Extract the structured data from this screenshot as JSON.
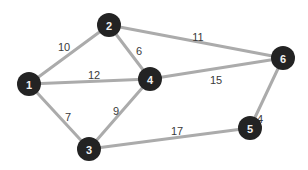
{
  "diagram": {
    "type": "weighted-undirected-graph",
    "colors": {
      "background": "#ffffff",
      "node_fill": "#232323",
      "node_text": "#f2f2f2",
      "edge": "#ababab",
      "edge_label": "#3a3a3a"
    },
    "node_radius": 12,
    "nodes": [
      {
        "id": "1",
        "label": "1",
        "x": 29,
        "y": 84
      },
      {
        "id": "2",
        "label": "2",
        "x": 109,
        "y": 25
      },
      {
        "id": "3",
        "label": "3",
        "x": 89,
        "y": 149
      },
      {
        "id": "4",
        "label": "4",
        "x": 150,
        "y": 79
      },
      {
        "id": "5",
        "label": "5",
        "x": 250,
        "y": 128
      },
      {
        "id": "6",
        "label": "6",
        "x": 283,
        "y": 58
      }
    ],
    "edges": [
      {
        "from": "1",
        "to": "2",
        "weight": "10",
        "label_x": 64,
        "label_y": 47
      },
      {
        "from": "1",
        "to": "4",
        "weight": "12",
        "label_x": 94,
        "label_y": 75
      },
      {
        "from": "1",
        "to": "3",
        "weight": "7",
        "label_x": 68,
        "label_y": 117
      },
      {
        "from": "2",
        "to": "4",
        "weight": "6",
        "label_x": 139,
        "label_y": 51
      },
      {
        "from": "2",
        "to": "6",
        "weight": "11",
        "label_x": 198,
        "label_y": 37
      },
      {
        "from": "4",
        "to": "6",
        "weight": "15",
        "label_x": 216,
        "label_y": 80
      },
      {
        "from": "4",
        "to": "3",
        "weight": "9",
        "label_x": 116,
        "label_y": 111
      },
      {
        "from": "3",
        "to": "5",
        "weight": "17",
        "label_x": 177,
        "label_y": 131
      },
      {
        "from": "5",
        "to": "6",
        "weight": "4",
        "label_x": 260,
        "label_y": 119
      }
    ]
  }
}
